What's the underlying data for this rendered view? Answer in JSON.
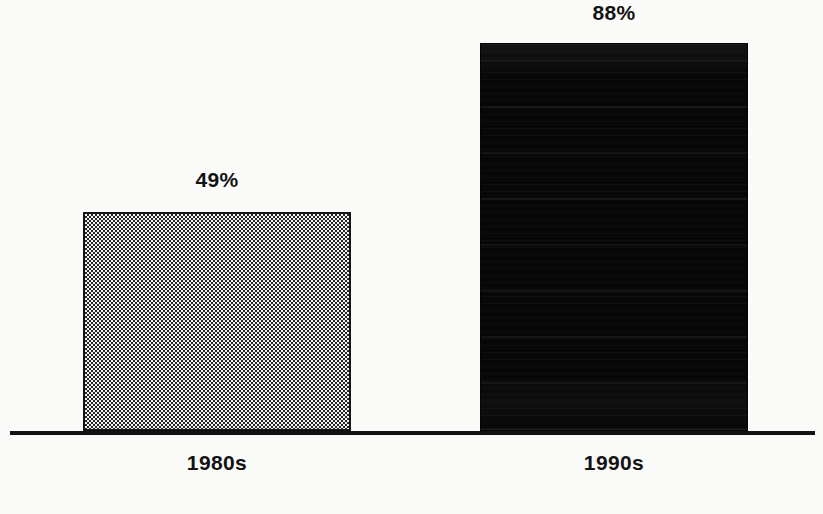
{
  "chart_data": {
    "type": "bar",
    "title": "",
    "subtitle": "",
    "xlabel": "",
    "ylabel": "",
    "categories": [
      "1980s",
      "1990s"
    ],
    "values": [
      49,
      88
    ],
    "value_labels": [
      "49%",
      "88%"
    ],
    "ylim": [
      0,
      100
    ],
    "grid": false,
    "legend": null,
    "series": [
      {
        "name": "",
        "values": [
          49,
          88
        ]
      }
    ],
    "annotations": [],
    "bar_styles": [
      {
        "category": "1980s",
        "fill": "checkered-dither",
        "border": "#141414"
      },
      {
        "category": "1990s",
        "fill": "solid-black",
        "border": "#050505"
      }
    ]
  },
  "colors": {
    "background": "#fbfbfa",
    "axis": "#121212",
    "text": "#131313",
    "bar_light_fill": "#f2f2f0",
    "bar_light_dither": "#262626",
    "bar_dark_fill": "#070707"
  },
  "axis": {
    "baseline_label": ""
  }
}
